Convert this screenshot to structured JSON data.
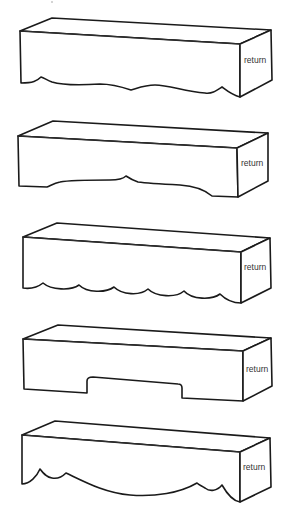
{
  "diagram": {
    "title": "",
    "stroke_color": "#1a1a1a",
    "background_color": "#ffffff",
    "panels": [
      {
        "id": "valance-1",
        "style": "wavy-bottom",
        "return_label": "return",
        "label_x": 244,
        "label_y": 63,
        "top": "M20,31 L52,18 L271,30 L240,44 Z",
        "front_edge": "M20,31 L240,44",
        "front": "M20,31 L240,44 L240,97 C232,95 226,90 222,87 C216,91 212,94 205,93 C185,92 170,85 155,85 C145,85 138,88 131,90 C122,87 112,84 100,84 C85,85 65,86 52,82 C47,80 44,78 41,77 C37,81 33,83 21,83 Z",
        "side": "M240,44 L271,30 L272,80 L240,97 Z"
      },
      {
        "id": "valance-2",
        "style": "gentle-arch-with-center-point",
        "return_label": "return",
        "label_x": 241,
        "label_y": 166,
        "top": "M18,136 L53,121 L268,133 L237,148 Z",
        "front_edge": "M18,136 L237,148",
        "front": "M18,136 L237,148 L238,197 L212,196 C205,190 195,186 180,185 C160,184 145,183 138,182 C132,180 129,178 126,176 C123,179 119,180 110,180 C90,180 70,180 60,182 C54,183 50,186 47,187 L19,186 Z",
        "side": "M237,148 L268,133 L268,181 L238,197 Z"
      },
      {
        "id": "valance-3",
        "style": "scalloped",
        "return_label": "return",
        "label_x": 244,
        "label_y": 270,
        "top": "M23,237 L57,223 L270,238 L241,252 Z",
        "front_edge": "M23,237 L241,252",
        "front": "M23,237 L241,252 L241,303 C232,303 225,299 220,294 C212,300 192,300 184,291 C176,298 156,297 148,289 C140,296 122,295 114,287 C106,293 87,293 79,285 C71,291 51,290 43,283 C38,287 30,289 23,288 Z",
        "side": "M241,252 L270,238 L271,288 L241,303 Z"
      },
      {
        "id": "valance-4",
        "style": "center-notch",
        "return_label": "return",
        "label_x": 246,
        "label_y": 372,
        "top": "M23,339 L58,325 L271,338 L243,351 Z",
        "front_edge": "M23,339 L243,351",
        "front": "M23,339 L243,351 L243,401 L182,398 L182,388 C182,385 180,384 178,384 L93,377 C89,377 87,378 87,381 L87,393 L24,389 Z",
        "side": "M243,351 L271,338 L272,386 L243,401 Z"
      },
      {
        "id": "valance-5",
        "style": "swag-with-scallops",
        "return_label": "return",
        "label_x": 243,
        "label_y": 470,
        "top": "M22,435 L55,421 L270,438 L240,452 Z",
        "front_edge": "M22,435 L240,452",
        "front": "M22,435 L240,452 L240,502 C232,501 226,492 222,485 C217,491 210,492 205,488 C202,486 199,485 197,483 C180,493 155,497 130,495 C105,493 85,482 66,473 C62,477 57,479 52,478 C46,477 43,473 40,469 C37,476 30,484 22,484 Z",
        "side": "M240,452 L270,438 L271,487 L240,502 Z"
      }
    ],
    "artifacts": [
      {
        "x": 52,
        "y": 2,
        "r": 0.7
      }
    ]
  }
}
